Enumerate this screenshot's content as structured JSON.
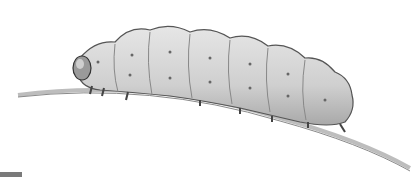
{
  "image": {
    "subject": "caterpillar on a twig",
    "style": "grayscale pencil illustration",
    "colors": {
      "background": "#ffffff",
      "body": "#d6d6d6",
      "outline": "#555555",
      "twig": "#bdbdbd",
      "scalebar": "#7a7a7a"
    }
  }
}
